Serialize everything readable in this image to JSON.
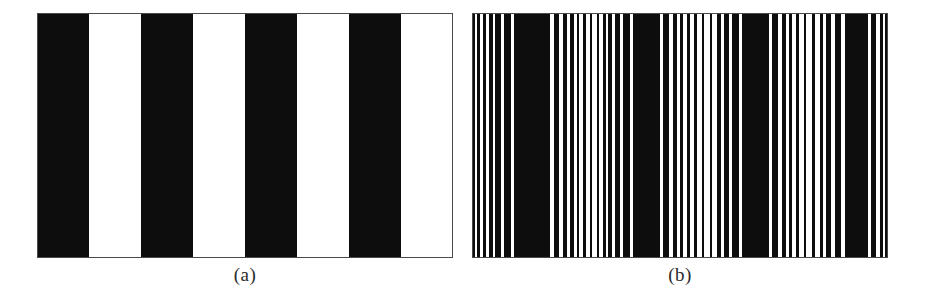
{
  "figure": {
    "background_color": "#ffffff",
    "ink_color": "#0d0d0d",
    "frame_color": "#4a4a4a",
    "panel_count": 2
  },
  "panels": [
    {
      "id": "panel-a",
      "caption": "(a)",
      "title": "square-wave grating",
      "x": 37,
      "y": 13,
      "width": 416,
      "height": 245,
      "stripe_count": 8,
      "black_stripe_count": 4,
      "white_stripe_count": 4,
      "period_count": 4,
      "pattern_type": "square-wave",
      "stripes": [
        {
          "start": 0.0,
          "end": 0.125,
          "color": "#0d0d0d"
        },
        {
          "start": 0.125,
          "end": 0.25,
          "color": "#ffffff"
        },
        {
          "start": 0.25,
          "end": 0.375,
          "color": "#0d0d0d"
        },
        {
          "start": 0.375,
          "end": 0.5,
          "color": "#ffffff"
        },
        {
          "start": 0.5,
          "end": 0.625,
          "color": "#0d0d0d"
        },
        {
          "start": 0.625,
          "end": 0.75,
          "color": "#ffffff"
        },
        {
          "start": 0.75,
          "end": 0.875,
          "color": "#0d0d0d"
        },
        {
          "start": 0.875,
          "end": 1.0,
          "color": "#ffffff"
        }
      ]
    },
    {
      "id": "panel-b",
      "caption": "(b)",
      "title": "dithered / halftoned grating",
      "x": 472,
      "y": 13,
      "width": 416,
      "height": 245,
      "stripe_count": 4,
      "black_stripe_count": 4,
      "white_stripe_count": 4,
      "period_count": 4,
      "pattern_type": "dithered-square-wave",
      "bars": [
        {
          "start": 0.0,
          "end": 0.007,
          "color": "#0d0d0d"
        },
        {
          "start": 0.012,
          "end": 0.019,
          "color": "#0d0d0d"
        },
        {
          "start": 0.026,
          "end": 0.034,
          "color": "#0d0d0d"
        },
        {
          "start": 0.04,
          "end": 0.05,
          "color": "#0d0d0d"
        },
        {
          "start": 0.056,
          "end": 0.069,
          "color": "#0d0d0d"
        },
        {
          "start": 0.077,
          "end": 0.094,
          "color": "#0d0d0d"
        },
        {
          "start": 0.101,
          "end": 0.188,
          "color": "#0d0d0d"
        },
        {
          "start": 0.196,
          "end": 0.21,
          "color": "#0d0d0d"
        },
        {
          "start": 0.218,
          "end": 0.228,
          "color": "#0d0d0d"
        },
        {
          "start": 0.236,
          "end": 0.244,
          "color": "#0d0d0d"
        },
        {
          "start": 0.252,
          "end": 0.258,
          "color": "#0d0d0d"
        },
        {
          "start": 0.268,
          "end": 0.273,
          "color": "#0d0d0d"
        },
        {
          "start": 0.283,
          "end": 0.288,
          "color": "#0d0d0d"
        },
        {
          "start": 0.3,
          "end": 0.306,
          "color": "#0d0d0d"
        },
        {
          "start": 0.314,
          "end": 0.321,
          "color": "#0d0d0d"
        },
        {
          "start": 0.328,
          "end": 0.337,
          "color": "#0d0d0d"
        },
        {
          "start": 0.344,
          "end": 0.356,
          "color": "#0d0d0d"
        },
        {
          "start": 0.364,
          "end": 0.38,
          "color": "#0d0d0d"
        },
        {
          "start": 0.388,
          "end": 0.452,
          "color": "#0d0d0d"
        },
        {
          "start": 0.46,
          "end": 0.474,
          "color": "#0d0d0d"
        },
        {
          "start": 0.482,
          "end": 0.492,
          "color": "#0d0d0d"
        },
        {
          "start": 0.5,
          "end": 0.508,
          "color": "#0d0d0d"
        },
        {
          "start": 0.518,
          "end": 0.524,
          "color": "#0d0d0d"
        },
        {
          "start": 0.534,
          "end": 0.54,
          "color": "#0d0d0d"
        },
        {
          "start": 0.552,
          "end": 0.558,
          "color": "#0d0d0d"
        },
        {
          "start": 0.572,
          "end": 0.578,
          "color": "#0d0d0d"
        },
        {
          "start": 0.59,
          "end": 0.598,
          "color": "#0d0d0d"
        },
        {
          "start": 0.606,
          "end": 0.618,
          "color": "#0d0d0d"
        },
        {
          "start": 0.626,
          "end": 0.642,
          "color": "#0d0d0d"
        },
        {
          "start": 0.65,
          "end": 0.714,
          "color": "#0d0d0d"
        },
        {
          "start": 0.722,
          "end": 0.736,
          "color": "#0d0d0d"
        },
        {
          "start": 0.744,
          "end": 0.754,
          "color": "#0d0d0d"
        },
        {
          "start": 0.762,
          "end": 0.77,
          "color": "#0d0d0d"
        },
        {
          "start": 0.78,
          "end": 0.786,
          "color": "#0d0d0d"
        },
        {
          "start": 0.798,
          "end": 0.804,
          "color": "#0d0d0d"
        },
        {
          "start": 0.818,
          "end": 0.824,
          "color": "#0d0d0d"
        },
        {
          "start": 0.836,
          "end": 0.844,
          "color": "#0d0d0d"
        },
        {
          "start": 0.852,
          "end": 0.864,
          "color": "#0d0d0d"
        },
        {
          "start": 0.872,
          "end": 0.888,
          "color": "#0d0d0d"
        },
        {
          "start": 0.896,
          "end": 0.952,
          "color": "#0d0d0d"
        },
        {
          "start": 0.96,
          "end": 0.972,
          "color": "#0d0d0d"
        },
        {
          "start": 0.98,
          "end": 0.987,
          "color": "#0d0d0d"
        },
        {
          "start": 0.993,
          "end": 1.0,
          "color": "#0d0d0d"
        }
      ]
    }
  ]
}
